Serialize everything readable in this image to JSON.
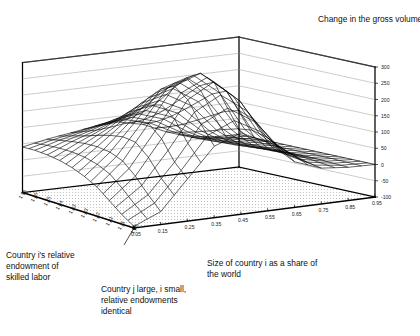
{
  "chart_data": {
    "type": "surface",
    "title": "Change in the gross volume of X trade",
    "xlabel": "Size of country i as a share of the world",
    "ylabel": "Country i's relative endowment of skilled labor",
    "zlabel": "Change in the gross volume of X trade",
    "origin_annotation": "Country j large, i small, relative endowments identical",
    "grid": false,
    "legend": "none",
    "xticks": [
      "0.05",
      "0.15",
      "0.25",
      "0.35",
      "0.45",
      "0.55",
      "0.65",
      "0.75",
      "0.85",
      "0.95"
    ],
    "yticks": [
      "1.00",
      "1.11",
      "1.21",
      "1.32",
      "1.43",
      "1.53",
      "1.64",
      "1.75",
      "1.85",
      "1.96"
    ],
    "zticks": [
      "300",
      "250",
      "200",
      "150",
      "100",
      "50",
      "0",
      "-50",
      "-100"
    ],
    "xlim": [
      0.05,
      0.95
    ],
    "ylim": [
      1.0,
      1.96
    ],
    "zlim": [
      -100,
      300
    ],
    "x": [
      0.05,
      0.15,
      0.25,
      0.35,
      0.45,
      0.55,
      0.65,
      0.75,
      0.85,
      0.95
    ],
    "y": [
      1.0,
      1.11,
      1.21,
      1.32,
      1.43,
      1.53,
      1.64,
      1.75,
      1.85,
      1.96
    ],
    "z": [
      [
        -95,
        -60,
        30,
        120,
        150,
        110,
        40,
        10,
        2,
        0
      ],
      [
        -70,
        -20,
        70,
        175,
        215,
        165,
        70,
        18,
        4,
        0
      ],
      [
        -40,
        25,
        130,
        240,
        285,
        215,
        95,
        25,
        6,
        0
      ],
      [
        -10,
        60,
        165,
        270,
        300,
        235,
        105,
        28,
        6,
        0
      ],
      [
        10,
        75,
        160,
        250,
        275,
        215,
        98,
        26,
        5,
        0
      ],
      [
        25,
        80,
        140,
        210,
        230,
        180,
        85,
        22,
        5,
        0
      ],
      [
        35,
        78,
        118,
        168,
        182,
        145,
        70,
        18,
        4,
        0
      ],
      [
        40,
        72,
        98,
        130,
        140,
        112,
        56,
        15,
        3,
        0
      ],
      [
        42,
        64,
        82,
        102,
        108,
        86,
        44,
        12,
        2,
        0
      ],
      [
        40,
        55,
        66,
        78,
        82,
        66,
        34,
        9,
        2,
        0
      ]
    ],
    "colors": {
      "line": "#000000",
      "floor": "#ffffff",
      "frame": "#000000"
    }
  },
  "title": {
    "text": "Change in the gross volume of X trade"
  },
  "axes": {
    "x_label": "Size of country i as a share of\nthe world",
    "y_label": "Country i's relative\nendowment of\nskilled labor",
    "corner_label": "Country j large, i small,\nrelative endowments\nidentical"
  }
}
